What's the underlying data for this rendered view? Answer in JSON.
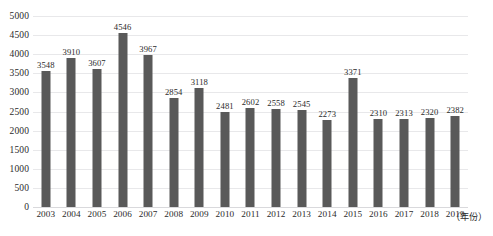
{
  "chart_data": {
    "type": "bar",
    "title": "",
    "subtitle": "",
    "xlabel": "（年份）",
    "ylabel": "",
    "categories": [
      "2003",
      "2004",
      "2005",
      "2006",
      "2007",
      "2008",
      "2009",
      "2010",
      "2011",
      "2012",
      "2013",
      "2014",
      "2015",
      "2016",
      "2017",
      "2018",
      "2019"
    ],
    "values": [
      3548,
      3910,
      3607,
      4546,
      3967,
      2854,
      3118,
      2481,
      2602,
      2558,
      2545,
      2273,
      3371,
      2310,
      2313,
      2320,
      2382
    ],
    "series": [
      {
        "name": "",
        "values": [
          3548,
          3910,
          3607,
          4546,
          3967,
          2854,
          3118,
          2481,
          2602,
          2558,
          2545,
          2273,
          3371,
          2310,
          2313,
          2320,
          2382
        ]
      }
    ],
    "ylim": [
      0,
      5000
    ],
    "ytick_labels": [
      "5000",
      "4500",
      "4000",
      "3500",
      "3000",
      "2500",
      "2000",
      "1500",
      "1000",
      "500",
      "0"
    ],
    "ytick_values": [
      5000,
      4500,
      4000,
      3500,
      3000,
      2500,
      2000,
      1500,
      1000,
      500,
      0
    ],
    "ytick_interval": 500,
    "grid": true,
    "grid_axis": "y",
    "legend": false,
    "legend_position": "none",
    "data_labels": true,
    "bar_color": "#595959",
    "gridline_color": "#e8e8ea",
    "text_color": "#2b2b2b",
    "background_color": "#ffffff",
    "annotations": []
  },
  "axis": {
    "x_title": "（年份）"
  }
}
